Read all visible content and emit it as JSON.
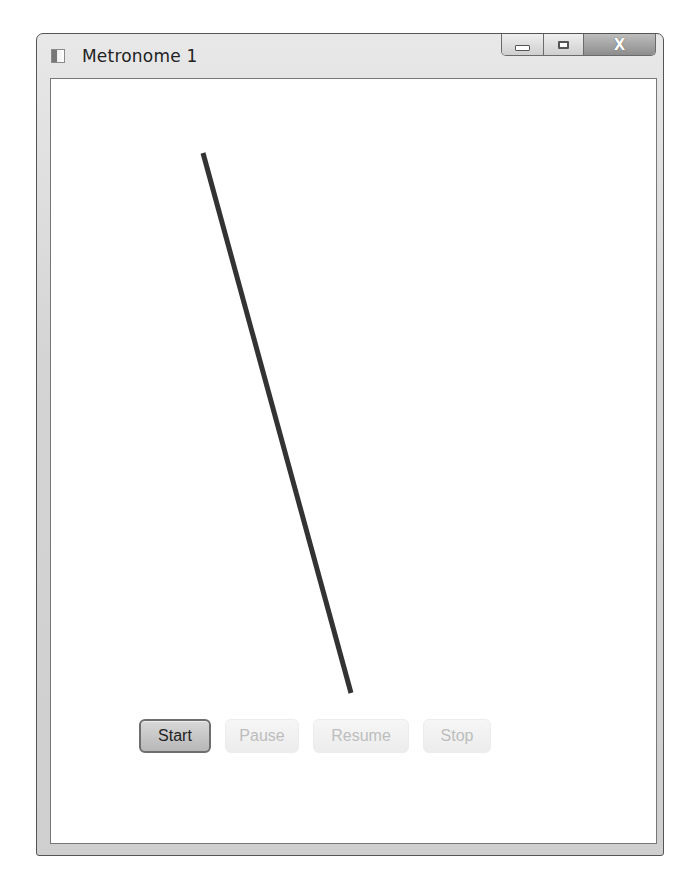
{
  "window": {
    "title": "Metronome 1",
    "icon": "app-window-icon",
    "caption_buttons": {
      "minimize": "minimize-icon",
      "maximize": "maximize-icon",
      "close_glyph": "X"
    }
  },
  "canvas": {
    "pendulum": {
      "x1": 152,
      "y1": 74,
      "x2": 300,
      "y2": 614,
      "stroke": "#333333",
      "stroke_width": 5
    }
  },
  "controls": {
    "start": {
      "label": "Start",
      "enabled": true
    },
    "pause": {
      "label": "Pause",
      "enabled": false
    },
    "resume": {
      "label": "Resume",
      "enabled": false
    },
    "stop": {
      "label": "Stop",
      "enabled": false
    }
  }
}
